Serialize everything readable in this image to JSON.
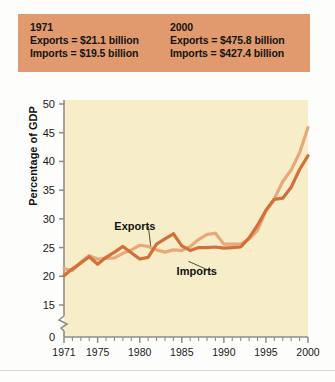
{
  "header": {
    "left": {
      "year": "1971",
      "exports": "Exports = $21.1 billion",
      "imports": "Imports = $19.5 billion"
    },
    "right": {
      "year": "2000",
      "exports": "Exports = $475.8 billion",
      "imports": "Imports = $427.4 billion"
    },
    "bg_color": "#e09a6e"
  },
  "chart_data": {
    "type": "line",
    "title": "",
    "xlabel": "",
    "ylabel": "Percentage of GDP",
    "ylim": [
      0,
      50
    ],
    "y_axis_break": true,
    "y_break_between": [
      0,
      15
    ],
    "ytick_labels": [
      "0",
      "15",
      "20",
      "25",
      "30",
      "35",
      "40",
      "45",
      "50"
    ],
    "ytick_values": [
      0,
      15,
      20,
      25,
      30,
      35,
      40,
      45,
      50
    ],
    "xlim": [
      1971,
      2000
    ],
    "xtick_labels": [
      "1971",
      "1975",
      "1980",
      "1985",
      "1990",
      "1995",
      "2000"
    ],
    "xtick_values": [
      1971,
      1975,
      1980,
      1985,
      1990,
      1995,
      2000
    ],
    "minor_xticks": "every year",
    "grid": false,
    "legend_position": "inline-annotations",
    "plot_bg_color": "#f7eec9",
    "x": [
      1971,
      1972,
      1973,
      1974,
      1975,
      1976,
      1977,
      1978,
      1979,
      1980,
      1981,
      1982,
      1983,
      1984,
      1985,
      1986,
      1987,
      1988,
      1989,
      1990,
      1991,
      1992,
      1993,
      1994,
      1995,
      1996,
      1997,
      1998,
      1999,
      2000
    ],
    "series": [
      {
        "name": "Exports",
        "color": "#e8a87c",
        "values": [
          21.3,
          21.0,
          22.5,
          23.6,
          23.0,
          23.1,
          23.2,
          24.0,
          24.6,
          25.4,
          25.2,
          24.6,
          24.2,
          24.6,
          24.5,
          25.2,
          26.4,
          27.3,
          27.5,
          25.6,
          25.6,
          25.6,
          26.5,
          28.0,
          31.4,
          33.5,
          36.5,
          38.5,
          41.5,
          45.9
        ]
      },
      {
        "name": "Imports",
        "color": "#d2703c",
        "values": [
          20.1,
          21.3,
          22.3,
          23.4,
          22.1,
          23.3,
          24.2,
          25.2,
          24.1,
          23.0,
          23.3,
          25.6,
          26.5,
          27.4,
          25.3,
          24.5,
          25.0,
          25.0,
          25.1,
          24.9,
          25.0,
          25.1,
          26.7,
          28.9,
          31.5,
          33.4,
          33.6,
          35.5,
          38.6,
          41.0
        ]
      }
    ],
    "annotations": [
      {
        "text": "Exports",
        "x": 1979.6,
        "y": 28.0,
        "leader_to": {
          "x": 1981.3,
          "y": 25.3
        }
      },
      {
        "text": "Imports",
        "x": 1987.0,
        "y": 20.2,
        "leader_to": {
          "x": 1985.8,
          "y": 22.6
        }
      }
    ]
  }
}
